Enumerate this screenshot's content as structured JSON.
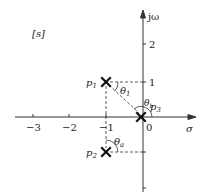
{
  "diagram": {
    "plane_label": "[s]",
    "axes": {
      "imag_label": "jω",
      "real_label": "σ",
      "x_ticks": [
        {
          "value": -3,
          "label": "−3"
        },
        {
          "value": -2,
          "label": "−2"
        },
        {
          "value": -1,
          "label": "−1"
        },
        {
          "value": 0,
          "label": "0"
        }
      ],
      "y_ticks": [
        {
          "value": 2,
          "label": "2"
        },
        {
          "value": 1,
          "label": "1"
        },
        {
          "value": -1,
          "label": ""
        }
      ]
    },
    "poles": [
      {
        "name": "p1",
        "label_main": "p",
        "label_sub": "1",
        "re": -1,
        "im": 1
      },
      {
        "name": "p2",
        "label_main": "p",
        "label_sub": "2",
        "re": -1,
        "im": -1
      },
      {
        "name": "p3",
        "label_main": "p",
        "label_sub": "3",
        "re": 0,
        "im": 0
      }
    ],
    "angles": [
      {
        "name": "theta1",
        "label_main": "θ",
        "label_sub": "1"
      },
      {
        "name": "thetab",
        "label_main": "θ",
        "label_sub": "b"
      },
      {
        "name": "thetaa",
        "label_main": "θ",
        "label_sub": "a"
      }
    ],
    "colors": {
      "ink": "#222222",
      "background": "#ffffff"
    }
  }
}
